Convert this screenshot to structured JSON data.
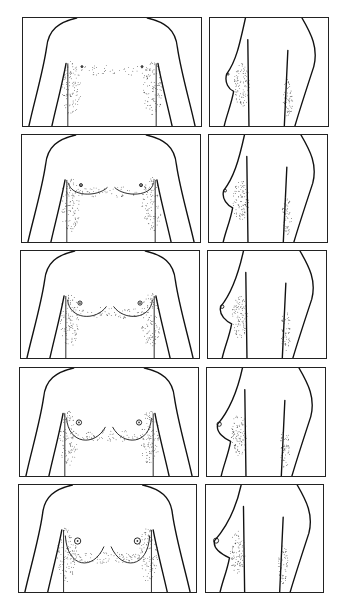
{
  "figure": {
    "type": "anatomical-line-drawing-series",
    "layout": {
      "rows": 5,
      "columns": 2,
      "views": [
        "front",
        "side"
      ]
    },
    "stages": [
      {
        "index": 1,
        "front": {
          "x": 22,
          "y": 17,
          "w": 180,
          "h": 110
        },
        "side": {
          "x": 209,
          "y": 17,
          "w": 120,
          "h": 110
        },
        "development": 0
      },
      {
        "index": 2,
        "front": {
          "x": 21,
          "y": 134,
          "w": 180,
          "h": 109
        },
        "side": {
          "x": 208,
          "y": 134,
          "w": 120,
          "h": 109
        },
        "development": 1
      },
      {
        "index": 3,
        "front": {
          "x": 20,
          "y": 250,
          "w": 180,
          "h": 109
        },
        "side": {
          "x": 207,
          "y": 250,
          "w": 120,
          "h": 109
        },
        "development": 2
      },
      {
        "index": 4,
        "front": {
          "x": 19,
          "y": 367,
          "w": 180,
          "h": 110
        },
        "side": {
          "x": 206,
          "y": 367,
          "w": 120,
          "h": 110
        },
        "development": 3
      },
      {
        "index": 5,
        "front": {
          "x": 18,
          "y": 484,
          "w": 179,
          "h": 109
        },
        "side": {
          "x": 205,
          "y": 484,
          "w": 119,
          "h": 109
        },
        "development": 4
      }
    ],
    "colors": {
      "line": "#111111",
      "border": "#222222",
      "background": "#ffffff",
      "stipple": "#333333"
    }
  }
}
